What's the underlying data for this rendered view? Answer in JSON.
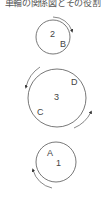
{
  "title": "車輪の関係図とその役割",
  "wheels": [
    {
      "id": "wheel-2",
      "number": "2",
      "point": "B"
    },
    {
      "id": "wheel-3",
      "number": "3",
      "points": [
        "D",
        "C"
      ]
    },
    {
      "id": "wheel-1",
      "number": "1",
      "point": "A"
    }
  ],
  "colors": {
    "stroke": "#555555",
    "text": "#444444"
  }
}
